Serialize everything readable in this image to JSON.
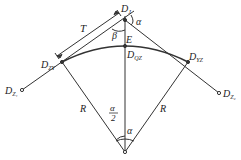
{
  "diagram": {
    "type": "circular-curve-geometry",
    "colors": {
      "line": "#333333",
      "text": "#222222",
      "background": "#ffffff"
    },
    "points": {
      "intersection": {
        "label": "D",
        "sub": "J",
        "x": 125,
        "y": 20
      },
      "curve_start": {
        "label": "D",
        "sub": "ZY",
        "x": 62,
        "y": 62
      },
      "curve_mid": {
        "label": "D",
        "sub": "QZ",
        "x": 125,
        "y": 46
      },
      "curve_end": {
        "label": "D",
        "sub": "YZ",
        "x": 188,
        "y": 62
      },
      "center": {
        "x": 125,
        "y": 152
      },
      "prev_station": {
        "label": "D",
        "sub": "Z₁",
        "x": 22,
        "y": 90
      },
      "next_station": {
        "label": "D",
        "sub": "Z₂",
        "x": 219,
        "y": 93
      }
    },
    "labels": {
      "tangent_length": "T",
      "external_distance": "E",
      "radius_left": "R",
      "radius_right": "R",
      "deflection_angle": "α",
      "half_angle_num": "α",
      "half_angle_den": "2",
      "center_angle": "α",
      "beta": "β"
    }
  }
}
